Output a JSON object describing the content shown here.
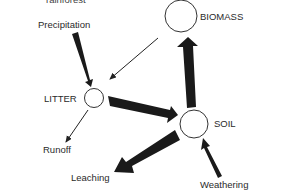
{
  "diagram": {
    "caption_cut": "rainforest",
    "nodes": [
      {
        "id": "biomass",
        "label": "BIOMASS"
      },
      {
        "id": "litter",
        "label": "LITTER"
      },
      {
        "id": "soil",
        "label": "SOIL"
      }
    ],
    "external": {
      "precipitation": "Precipitation",
      "runoff": "Runoff",
      "leaching": "Leaching",
      "weathering": "Weathering"
    },
    "flows": [
      {
        "from": "Precipitation",
        "to": "LITTER",
        "weight": "heavy"
      },
      {
        "from": "BIOMASS",
        "to": "LITTER",
        "weight": "thin"
      },
      {
        "from": "LITTER",
        "to": "SOIL",
        "weight": "heavy"
      },
      {
        "from": "SOIL",
        "to": "BIOMASS",
        "weight": "heavy"
      },
      {
        "from": "LITTER",
        "to": "Runoff",
        "weight": "thin"
      },
      {
        "from": "SOIL",
        "to": "Leaching",
        "weight": "heavy"
      },
      {
        "from": "Weathering",
        "to": "SOIL",
        "weight": "medium"
      }
    ]
  }
}
